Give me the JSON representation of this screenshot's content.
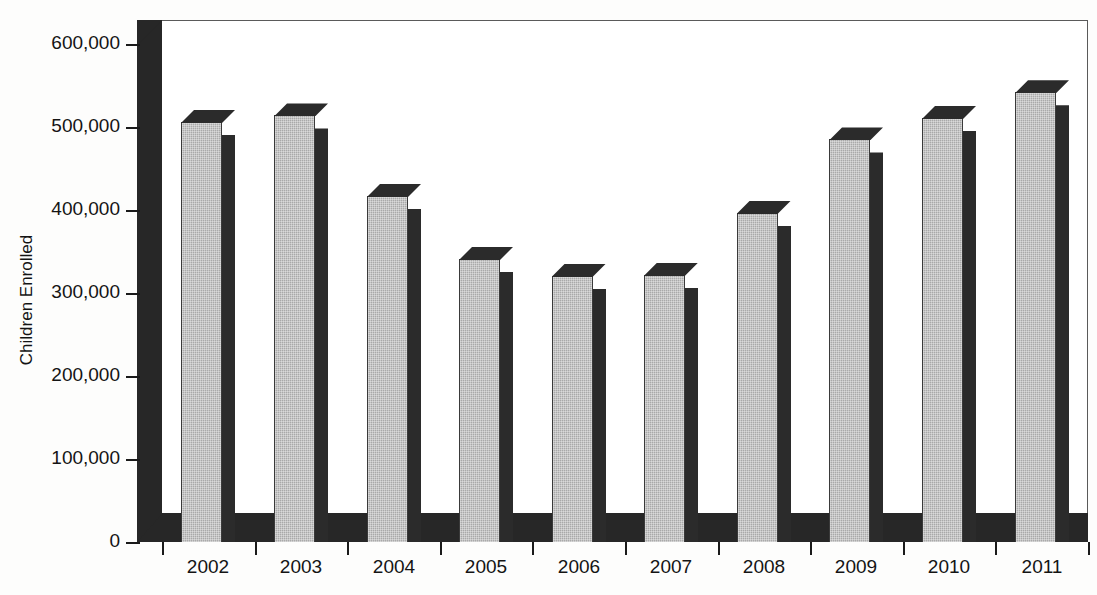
{
  "chart_data": {
    "type": "bar",
    "title": "",
    "xlabel": "",
    "ylabel": "Children Enrolled",
    "categories": [
      "2002",
      "2003",
      "2004",
      "2005",
      "2006",
      "2007",
      "2008",
      "2009",
      "2010",
      "2011"
    ],
    "values": [
      506000,
      514000,
      417000,
      341000,
      321000,
      322000,
      397000,
      485000,
      511000,
      542000
    ],
    "ylim": [
      0,
      600000
    ],
    "ytick_values": [
      0,
      100000,
      200000,
      300000,
      400000,
      500000,
      600000
    ],
    "ytick_labels": [
      "0",
      "100,000",
      "200,000",
      "300,000",
      "400,000",
      "500,000",
      "600,000"
    ],
    "grid": false,
    "legend": null,
    "style": "3d-bar",
    "colors": {
      "bar_face": "#a9a9a9",
      "bar_shade": "#2b2b2b",
      "axis": "#1a1a1a",
      "plot_background": "#ffffff"
    }
  }
}
